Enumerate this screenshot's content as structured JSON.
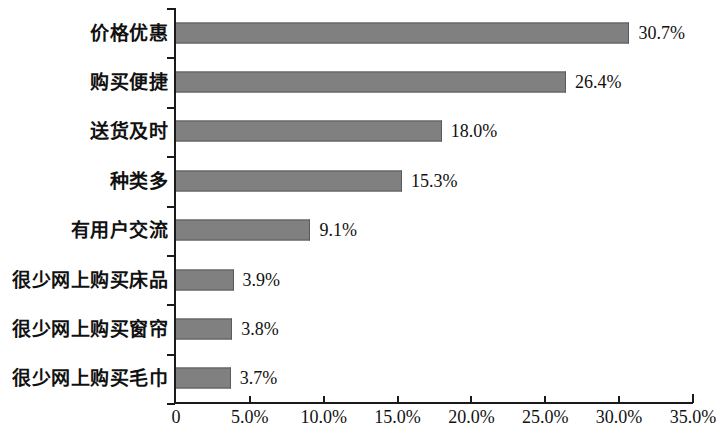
{
  "chart_data": {
    "type": "bar",
    "orientation": "horizontal",
    "title": "",
    "subtitle": "",
    "xlabel": "",
    "ylabel": "",
    "xlim": [
      0,
      35
    ],
    "ylim": null,
    "grid": false,
    "legend": null,
    "bar_color": "#808080",
    "bar_edge_color": "#5a5a5a",
    "axis_color": "#1a1a1a",
    "background": "#ffffff",
    "categories": [
      "价格优惠",
      "购买便捷",
      "送货及时",
      "种类多",
      "有用户交流",
      "很少网上购买床品",
      "很少网上购买窗帘",
      "很少网上购买毛巾"
    ],
    "values": [
      30.7,
      26.4,
      18.0,
      15.3,
      9.1,
      3.9,
      3.8,
      3.7
    ],
    "data_labels": [
      "30.7%",
      "26.4%",
      "18.0%",
      "15.3%",
      "9.1%",
      "3.9%",
      "3.8%",
      "3.7%"
    ],
    "xticks": [
      0,
      5,
      10,
      15,
      20,
      25,
      30,
      35
    ],
    "xtick_labels": [
      "0",
      "5.0%",
      "10.0%",
      "15.0%",
      "20.0%",
      "25.0%",
      "30.0%",
      "35.0%"
    ]
  },
  "rows": [
    {
      "label": "价格优惠",
      "value_label": "30.7%",
      "value": 30.7
    },
    {
      "label": "购买便捷",
      "value_label": "26.4%",
      "value": 26.4
    },
    {
      "label": "送货及时",
      "value_label": "18.0%",
      "value": 18.0
    },
    {
      "label": "种类多",
      "value_label": "15.3%",
      "value": 15.3
    },
    {
      "label": "有用户交流",
      "value_label": "9.1%",
      "value": 9.1
    },
    {
      "label": "很少网上购买床品",
      "value_label": "3.9%",
      "value": 3.9
    },
    {
      "label": "很少网上购买窗帘",
      "value_label": "3.8%",
      "value": 3.8
    },
    {
      "label": "很少网上购买毛巾",
      "value_label": "3.7%",
      "value": 3.7
    }
  ],
  "xaxis": {
    "labels": [
      "0",
      "5.0%",
      "10.0%",
      "15.0%",
      "20.0%",
      "25.0%",
      "30.0%",
      "35.0%"
    ]
  }
}
